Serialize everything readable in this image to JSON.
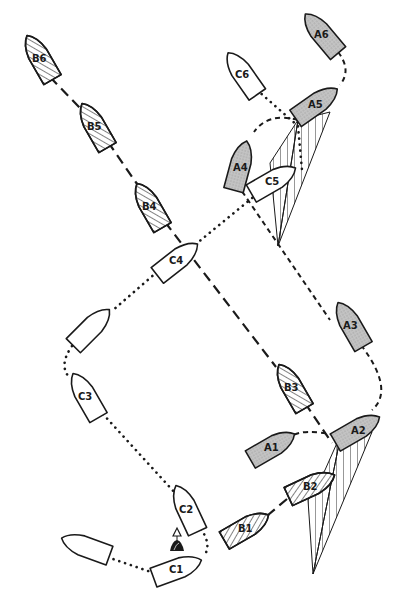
{
  "diagram": {
    "type": "sailing-rules-boat-positions",
    "colors": {
      "outline": "#1a1a1a",
      "boat_a_fill": "#b8b8b8",
      "boat_b_fill": "hatched",
      "boat_c_fill": "#ffffff",
      "background": "#ffffff"
    },
    "mark": {
      "icon": "buoy-mark-icon",
      "x": 177,
      "y": 552
    },
    "boats": {
      "A": [
        {
          "label": "A1",
          "x": 272,
          "y": 447,
          "angle": -30
        },
        {
          "label": "A2",
          "x": 357,
          "y": 430,
          "angle": -30
        },
        {
          "label": "A3",
          "x": 351,
          "y": 325,
          "angle": 150
        },
        {
          "label": "A4",
          "x": 242,
          "y": 164,
          "angle": 15
        },
        {
          "label": "A5",
          "x": 319,
          "y": 106,
          "angle": -35
        },
        {
          "label": "A6",
          "x": 322,
          "y": 32,
          "angle": 140
        }
      ],
      "B": [
        {
          "label": "B1",
          "x": 246,
          "y": 528,
          "angle": -30
        },
        {
          "label": "B2",
          "x": 311,
          "y": 486,
          "angle": -25
        },
        {
          "label": "B3",
          "x": 292,
          "y": 387,
          "angle": 150
        },
        {
          "label": "B4",
          "x": 150,
          "y": 204,
          "angle": 150
        },
        {
          "label": "B5",
          "x": 94,
          "y": 125,
          "angle": 150
        },
        {
          "label": "B6",
          "x": 38,
          "y": 57,
          "angle": 150
        }
      ],
      "C": [
        {
          "label": "C1",
          "x": 177,
          "y": 571,
          "angle": -20
        },
        {
          "label": "C2",
          "x": 189,
          "y": 512,
          "angle": 155
        },
        {
          "label": "C3",
          "x": 88,
          "y": 397,
          "angle": 155
        },
        {
          "label": "",
          "x": 91,
          "y": 326,
          "angle": -45
        },
        {
          "label": "C4",
          "x": 176,
          "y": 259,
          "angle": -40
        },
        {
          "label": "C5",
          "x": 273,
          "y": 181,
          "angle": -30
        },
        {
          "label": "C6",
          "x": 243,
          "y": 72,
          "angle": 150
        },
        {
          "label": "",
          "x": 86,
          "y": 547,
          "angle": 20
        }
      ]
    },
    "tracks": {
      "A": {
        "style": "short-dash"
      },
      "B": {
        "style": "long-dash"
      },
      "C": {
        "style": "dotted"
      }
    },
    "sectors": [
      {
        "name": "overlap-zone-A2"
      },
      {
        "name": "overlap-zone-A5"
      }
    ]
  }
}
